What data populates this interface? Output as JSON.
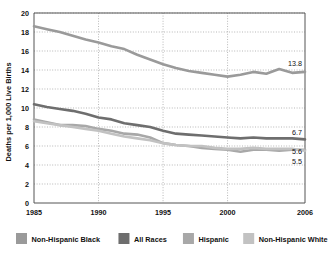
{
  "chart_data": {
    "type": "line",
    "title": "",
    "xlabel": "",
    "ylabel": "Deaths per 1,000 Live Births",
    "xlim": [
      1985,
      2006
    ],
    "ylim": [
      0,
      20
    ],
    "xticks": [
      "1985",
      "1990",
      "1995",
      "2000",
      "2006"
    ],
    "xtick_values": [
      1985,
      1990,
      1995,
      2000,
      2006
    ],
    "yticks": [
      "0",
      "2",
      "4",
      "6",
      "8",
      "10",
      "12",
      "14",
      "16",
      "18",
      "20"
    ],
    "ytick_values": [
      0,
      2,
      4,
      6,
      8,
      10,
      12,
      14,
      16,
      18,
      20
    ],
    "grid": true,
    "grid_style": "dotted",
    "legend_position": "bottom",
    "x": [
      1985,
      1986,
      1987,
      1988,
      1989,
      1990,
      1991,
      1992,
      1993,
      1994,
      1995,
      1996,
      1997,
      1998,
      1999,
      2000,
      2001,
      2002,
      2003,
      2004,
      2005,
      2006
    ],
    "series": [
      {
        "name": "Non-Hispanic Black",
        "color": "#9a9a9a",
        "end_label": "13.8",
        "values": [
          18.6,
          18.3,
          18.0,
          17.6,
          17.2,
          16.9,
          16.5,
          16.2,
          15.6,
          15.1,
          14.6,
          14.2,
          13.9,
          13.7,
          13.5,
          13.3,
          13.5,
          13.8,
          13.6,
          14.1,
          13.7,
          13.8
        ]
      },
      {
        "name": "All Races",
        "color": "#6e6e6e",
        "end_label": "6.7",
        "values": [
          10.4,
          10.1,
          9.9,
          9.7,
          9.4,
          9.0,
          8.8,
          8.4,
          8.2,
          8.0,
          7.6,
          7.3,
          7.2,
          7.1,
          7.0,
          6.9,
          6.8,
          6.9,
          6.8,
          6.8,
          6.8,
          6.7
        ]
      },
      {
        "name": "Hispanic",
        "color": "#a8a8a8",
        "end_label": "5.6",
        "values": [
          8.8,
          8.5,
          8.2,
          8.2,
          8.1,
          7.8,
          7.6,
          7.3,
          7.2,
          6.9,
          6.3,
          6.1,
          6.0,
          5.8,
          5.7,
          5.6,
          5.4,
          5.6,
          5.6,
          5.5,
          5.6,
          5.6
        ]
      },
      {
        "name": "Non-Hispanic White",
        "color": "#c2c2c2",
        "end_label": "5.5",
        "values": [
          8.6,
          8.4,
          8.2,
          8.0,
          7.8,
          7.6,
          7.3,
          7.0,
          6.8,
          6.6,
          6.3,
          6.1,
          6.0,
          6.0,
          5.8,
          5.7,
          5.7,
          5.8,
          5.7,
          5.7,
          5.7,
          5.5
        ]
      }
    ],
    "end_labels": [
      {
        "text": "13.8",
        "value": 13.8
      },
      {
        "text": "6.7",
        "value": 6.7
      },
      {
        "text": "5.6",
        "value": 5.6
      },
      {
        "text": "5.5",
        "value": 5.5
      }
    ],
    "legend": [
      {
        "label": "Non-Hispanic Black",
        "color": "#9a9a9a"
      },
      {
        "label": "All Races",
        "color": "#6e6e6e"
      },
      {
        "label": "Hispanic",
        "color": "#a8a8a8"
      },
      {
        "label": "Non-Hispanic White",
        "color": "#c2c2c2"
      }
    ],
    "colors": {
      "axis": "#555555",
      "grid": "#9a9a9a",
      "text": "#111111",
      "background": "#ffffff"
    }
  }
}
